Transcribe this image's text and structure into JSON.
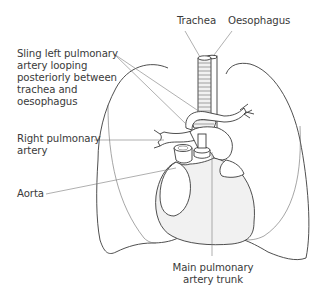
{
  "figure": {
    "labels": {
      "trachea": "Trachea",
      "oesophagus": "Oesophagus",
      "sling": "Sling left pulmonary\nartery looping\nposteriorly between\ntrachea and\noesophagus",
      "right_pa": "Right pulmonary\nartery",
      "aorta": "Aorta",
      "main_pa": "Main pulmonary\nartery trunk"
    },
    "colors": {
      "line": "#3b3b3b",
      "leader": "#7a7a7a",
      "text": "#3a3a3a",
      "shading": "#f1f1f1"
    }
  }
}
